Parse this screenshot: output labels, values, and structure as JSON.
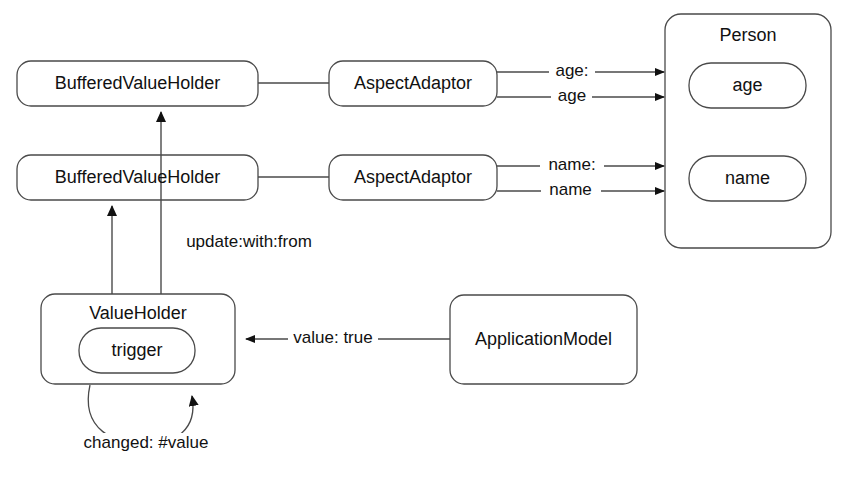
{
  "diagram": {
    "background_color": "#ffffff",
    "stroke_color": "#4a4a4a",
    "text_color": "#111111",
    "nodes": {
      "buffered_value_holder_age": "BufferedValueHolder",
      "buffered_value_holder_name": "BufferedValueHolder",
      "aspect_adaptor_age": "AspectAdaptor",
      "aspect_adaptor_name": "AspectAdaptor",
      "person": "Person",
      "person_age_slot": "age",
      "person_name_slot": "name",
      "value_holder": "ValueHolder",
      "value_holder_trigger": "trigger",
      "application_model": "ApplicationModel"
    },
    "edge_labels": {
      "age_setter": "age:",
      "age_getter": "age",
      "name_setter": "name:",
      "name_getter": "name",
      "update_with_from": "update:with:from",
      "value_true": "value: true",
      "changed_value": "changed: #value"
    }
  }
}
